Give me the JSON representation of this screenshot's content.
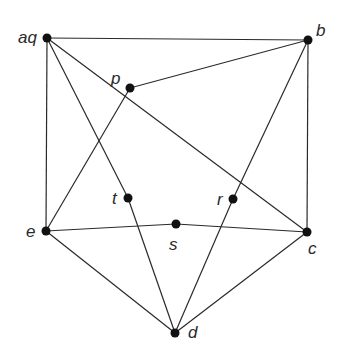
{
  "diagram": {
    "type": "graph",
    "node_color": "#111111",
    "edge_color": "#2a2a2a",
    "nodes": [
      {
        "id": "aq",
        "label": "aq",
        "x": 47,
        "y": 38,
        "lx": 18,
        "ly": 43
      },
      {
        "id": "b",
        "label": "b",
        "x": 308,
        "y": 40,
        "lx": 316,
        "ly": 36
      },
      {
        "id": "p",
        "label": "p",
        "x": 130,
        "y": 88,
        "lx": 111,
        "ly": 84
      },
      {
        "id": "t",
        "label": "t",
        "x": 128,
        "y": 198,
        "lx": 112,
        "ly": 204
      },
      {
        "id": "r",
        "label": "r",
        "x": 233,
        "y": 199,
        "lx": 217,
        "ly": 205
      },
      {
        "id": "s",
        "label": "s",
        "x": 176,
        "y": 224,
        "lx": 169,
        "ly": 250
      },
      {
        "id": "e",
        "label": "e",
        "x": 46,
        "y": 231,
        "lx": 26,
        "ly": 237
      },
      {
        "id": "c",
        "label": "c",
        "x": 307,
        "y": 232,
        "lx": 308,
        "ly": 254
      },
      {
        "id": "d",
        "label": "d",
        "x": 175,
        "y": 333,
        "lx": 188,
        "ly": 338
      }
    ],
    "edges": [
      [
        "aq",
        "b"
      ],
      [
        "aq",
        "e"
      ],
      [
        "aq",
        "t"
      ],
      [
        "aq",
        "c"
      ],
      [
        "b",
        "p"
      ],
      [
        "b",
        "r"
      ],
      [
        "b",
        "c"
      ],
      [
        "p",
        "e"
      ],
      [
        "t",
        "d"
      ],
      [
        "r",
        "d"
      ],
      [
        "e",
        "s"
      ],
      [
        "s",
        "c"
      ],
      [
        "e",
        "d"
      ],
      [
        "c",
        "d"
      ]
    ]
  }
}
